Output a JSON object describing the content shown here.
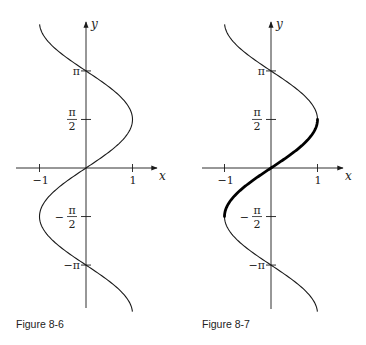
{
  "figures": [
    {
      "id": "fig-8-6",
      "caption": "Figure 8-6",
      "origin": [
        86,
        168
      ],
      "x_unit_px": 46.5,
      "y_unit_px": 30.9,
      "x_axis": {
        "label": "x",
        "from": 16,
        "to": 157
      },
      "y_axis": {
        "label": "y",
        "from": 308,
        "to": 22
      },
      "x_ticks": [
        {
          "value": -1,
          "label": "−1"
        },
        {
          "value": 1,
          "label": "1"
        }
      ],
      "y_ticks": [
        {
          "value": 3.14159,
          "label": "π",
          "kind": "simple"
        },
        {
          "value": 1.5708,
          "num": "π",
          "den": "2",
          "sign": "",
          "kind": "frac"
        },
        {
          "value": -1.5708,
          "num": "π",
          "den": "2",
          "sign": "−",
          "kind": "frac"
        },
        {
          "value": -3.14159,
          "label": "−π",
          "kind": "simple"
        }
      ],
      "highlight": null
    },
    {
      "id": "fig-8-7",
      "caption": "Figure 8-7",
      "origin": [
        271,
        168
      ],
      "x_unit_px": 46.5,
      "y_unit_px": 30.9,
      "x_axis": {
        "label": "x",
        "from": 202,
        "to": 343
      },
      "y_axis": {
        "label": "y",
        "from": 309,
        "to": 22
      },
      "x_ticks": [
        {
          "value": -1,
          "label": "−1"
        },
        {
          "value": 1,
          "label": "1"
        }
      ],
      "y_ticks": [
        {
          "value": 3.14159,
          "label": "π",
          "kind": "simple"
        },
        {
          "value": 1.5708,
          "num": "π",
          "den": "2",
          "sign": "",
          "kind": "frac"
        },
        {
          "value": -1.5708,
          "num": "π",
          "den": "2",
          "sign": "−",
          "kind": "frac"
        },
        {
          "value": -3.14159,
          "label": "−π",
          "kind": "simple"
        }
      ],
      "highlight": {
        "y_from": -1.5708,
        "y_to": 1.5708
      }
    }
  ],
  "chart_data": [
    {
      "type": "line",
      "title": "Figure 8-6",
      "description": "Graph of x = sin y",
      "xlabel": "x",
      "ylabel": "y",
      "x_ticks": [
        -1,
        1
      ],
      "y_tick_labels": [
        "π",
        "π/2",
        "−π/2",
        "−π"
      ],
      "y_range": [
        -4.65,
        4.65
      ],
      "xlim": [
        -1.5,
        1.5
      ],
      "grid": false
    },
    {
      "type": "line",
      "title": "Figure 8-7",
      "description": "Graph of x = sin y with the branch -π/2 ≤ y ≤ π/2 drawn bold",
      "xlabel": "x",
      "ylabel": "y",
      "x_ticks": [
        -1,
        1
      ],
      "y_tick_labels": [
        "π",
        "π/2",
        "−π/2",
        "−π"
      ],
      "y_range": [
        -4.65,
        4.65
      ],
      "highlight_range_y": [
        -1.5708,
        1.5708
      ],
      "xlim": [
        -1.5,
        1.5
      ],
      "grid": false
    }
  ]
}
